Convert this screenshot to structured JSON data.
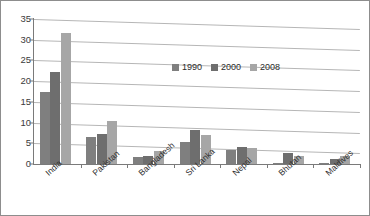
{
  "chart_data": {
    "type": "bar",
    "title": "",
    "subtitle": "",
    "xlabel": "",
    "ylabel": "",
    "categories": [
      "India",
      "Pakistan",
      "Bangladesh",
      "Sri Lanka",
      "Nepal",
      "Bhutan",
      "Maldives"
    ],
    "series": [
      {
        "name": "1990",
        "color": "#7f7f7f",
        "values": [
          17.5,
          6.5,
          1.6,
          5.3,
          3.3,
          0.2,
          0.15
        ]
      },
      {
        "name": "2000",
        "color": "#6e6e6e",
        "values": [
          22.2,
          7.3,
          1.9,
          8.3,
          4.1,
          2.6,
          1.2
        ]
      },
      {
        "name": "2008",
        "color": "#a6a6a6",
        "values": [
          31.6,
          10.3,
          3.1,
          6.9,
          3.8,
          1.9,
          1.9
        ]
      }
    ],
    "ylim": [
      0,
      35
    ],
    "yticks": [
      0,
      5,
      10,
      15,
      20,
      25,
      30,
      35
    ],
    "ytick_labels": [
      "0",
      "5",
      "10",
      "15",
      "20",
      "25",
      "30",
      "35"
    ],
    "grid": true,
    "legend_position": "top-center",
    "legend_entries": [
      "1990",
      "2000",
      "2008"
    ]
  },
  "style": {
    "grid_color": "#b6b6b6",
    "axis_color": "#7a7a7a",
    "border_color": "#8d8d8d",
    "background": "#ffffff",
    "text_color": "#2e2e2e"
  }
}
